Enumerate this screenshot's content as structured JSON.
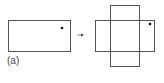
{
  "figure": {
    "label": "(a)",
    "stroke_color": "#555555",
    "dot_color": "#111111",
    "left_rectangle": {
      "x": 8,
      "y": 20,
      "width": 62,
      "height": 31,
      "dot": {
        "cx": 62,
        "cy": 28
      }
    },
    "arrow": {
      "x1": 77,
      "y1": 35,
      "x2": 83,
      "y2": 35
    },
    "cross": {
      "horizontal_rectangle": {
        "x": 95,
        "y": 20,
        "width": 59,
        "height": 31
      },
      "vertical_rectangle": {
        "x": 110,
        "y": 5,
        "width": 29,
        "height": 61
      },
      "dot": {
        "cx": 150,
        "cy": 24
      }
    }
  }
}
